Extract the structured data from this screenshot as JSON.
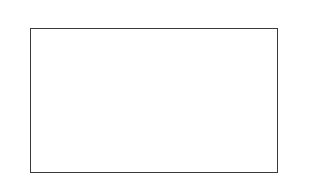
{
  "chart_data": {
    "type": "bar",
    "orientation": "horizontal",
    "xscale": "log",
    "title": "",
    "xlabel": "ppm",
    "ylabel": "",
    "xlim": [
      0.00025,
      200
    ],
    "x_ticks": [
      0.001,
      0.01,
      0.1,
      1.0,
      10,
      100
    ],
    "x_tick_labels": [
      "0,001",
      "0,01",
      "0,1",
      "1,0",
      "10",
      "100"
    ],
    "unit_label": "ppm",
    "categories": [
      "Mn",
      "Ag",
      "Cu",
      "Cr",
      "Al",
      "Pb",
      "Sn",
      "Cd",
      "Zn",
      "Ca",
      "Fe",
      "Ni",
      "V"
    ],
    "series": [
      {
        "name": "range_max",
        "values": [
          0.14,
          0.46,
          0.8,
          1.06,
          1.4,
          1.8,
          1.8,
          2.6,
          2.6,
          4.5,
          7.8,
          19,
          57
        ]
      },
      {
        "name": "marker",
        "values": [
          0.043,
          0.135,
          0.31,
          0.57,
          1.0,
          0.76,
          null,
          0.76,
          0.76,
          1.3,
          2.3,
          7.4,
          24
        ]
      }
    ],
    "grid": false,
    "legend": "none",
    "axes_top_and_bottom": true
  },
  "axis": {
    "ticks": [
      {
        "label": "0,001",
        "x": 49
      },
      {
        "label": "0,01",
        "x": 91
      },
      {
        "label": "0,1",
        "x": 132
      },
      {
        "label": "1,0",
        "x": 174
      },
      {
        "label": "1 0",
        "x": 216
      },
      {
        "label": "100",
        "x": 257
      }
    ],
    "unit": "ppm"
  },
  "rows": [
    {
      "label": "Mn",
      "y": 39,
      "end": 139,
      "mark": 117
    },
    {
      "label": "Ag",
      "y": 49,
      "end": 160,
      "mark": 138
    },
    {
      "label": "Cu",
      "y": 59,
      "end": 170,
      "mark": 153
    },
    {
      "label": "Cr",
      "y": 69,
      "end": 175,
      "mark": 164
    },
    {
      "label": "Al",
      "y": 79,
      "end": 180,
      "mark": 174
    },
    {
      "label": "Pb",
      "y": 89,
      "end": 185,
      "mark": 169
    },
    {
      "label": "Sn",
      "y": 100,
      "end": 185,
      "mark": null
    },
    {
      "label": "Cd",
      "y": 110,
      "end": 191,
      "mark": 169
    },
    {
      "label": "Zn",
      "y": 120,
      "end": 191,
      "mark": 169
    },
    {
      "label": "Ca",
      "y": 130,
      "end": 201,
      "mark": 179
    },
    {
      "label": "Fe",
      "y": 141,
      "end": 211,
      "mark": 189
    },
    {
      "label": "Ni",
      "y": 151,
      "end": 227,
      "mark": 210
    },
    {
      "label": "V",
      "y": 162,
      "end": 247,
      "mark": 231
    }
  ]
}
